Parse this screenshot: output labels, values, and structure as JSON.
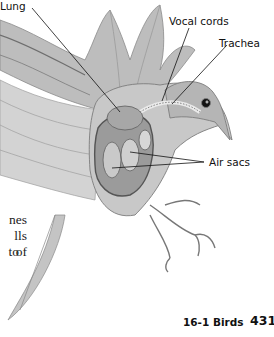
{
  "figure": {
    "labels": {
      "lung": "Lung",
      "vocal_cords": "Vocal cords",
      "trachea": "Trachea",
      "air_sacs": "Air sacs"
    }
  },
  "body_text": {
    "line1": "nes",
    "line2": "lls of",
    "line3": "to"
  },
  "footer": {
    "section": "16-1 Birds",
    "page_number": "431"
  }
}
